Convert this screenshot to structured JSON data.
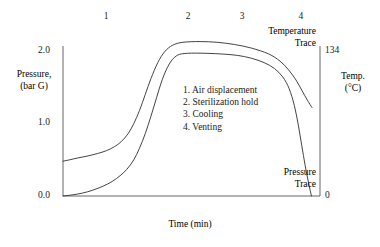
{
  "chart_data": {
    "type": "line",
    "title": "",
    "xlabel": "Time (min)",
    "ylabel": "Pressure,\n(bar G)",
    "y2label": "Temp.\n(°C)",
    "grid": false,
    "legend_position": "inline-annotations",
    "x_axis": {
      "label": "Time (min)",
      "tick_labels": [],
      "range": [
        0,
        4.5
      ]
    },
    "y_axis_left": {
      "label_line1": "Pressure,",
      "label_line2": "(bar G)",
      "tick_labels": [
        "2.0",
        "1.0",
        "0.0"
      ],
      "tick_values": [
        2.0,
        1.0,
        0.0
      ],
      "range": [
        0,
        2.2
      ]
    },
    "y_axis_right": {
      "label_line1": "Temp.",
      "label_line2": "(°C)",
      "tick_labels": [
        "134",
        "0"
      ],
      "tick_values": [
        134,
        0
      ],
      "range": [
        0,
        147
      ]
    },
    "phase_markers": [
      {
        "number": "1",
        "x_frac": 0.168
      },
      {
        "number": "2",
        "x_frac": 0.487
      },
      {
        "number": "3",
        "x_frac": 0.697
      },
      {
        "number": "4",
        "x_frac": 0.926
      }
    ],
    "series": [
      {
        "name": "Temperature Trace",
        "label_line1": "Temperature",
        "label_line2": "Trace",
        "color": "#3a3a3a",
        "axis": "right",
        "points": [
          [
            0.0,
            0.48
          ],
          [
            0.12,
            0.5
          ],
          [
            0.26,
            0.525
          ],
          [
            0.42,
            0.55
          ],
          [
            0.6,
            0.585
          ],
          [
            0.76,
            0.625
          ],
          [
            0.9,
            0.68
          ],
          [
            1.02,
            0.75
          ],
          [
            1.14,
            0.86
          ],
          [
            1.24,
            1.0
          ],
          [
            1.34,
            1.18
          ],
          [
            1.44,
            1.4
          ],
          [
            1.54,
            1.62
          ],
          [
            1.66,
            1.84
          ],
          [
            1.78,
            1.99
          ],
          [
            1.92,
            2.08
          ],
          [
            2.1,
            2.12
          ],
          [
            2.4,
            2.13
          ],
          [
            2.7,
            2.12
          ],
          [
            3.0,
            2.09
          ],
          [
            3.3,
            2.04
          ],
          [
            3.6,
            1.96
          ],
          [
            3.8,
            1.86
          ],
          [
            3.95,
            1.74
          ],
          [
            4.08,
            1.6
          ],
          [
            4.18,
            1.46
          ],
          [
            4.28,
            1.32
          ],
          [
            4.36,
            1.22
          ]
        ]
      },
      {
        "name": "Pressure Trace",
        "label_line1": "Pressure",
        "label_line2": "Trace",
        "color": "#3a3a3a",
        "axis": "left",
        "points": [
          [
            0.0,
            0.0
          ],
          [
            0.16,
            0.015
          ],
          [
            0.34,
            0.04
          ],
          [
            0.52,
            0.08
          ],
          [
            0.7,
            0.135
          ],
          [
            0.86,
            0.2
          ],
          [
            1.0,
            0.28
          ],
          [
            1.12,
            0.37
          ],
          [
            1.24,
            0.5
          ],
          [
            1.34,
            0.66
          ],
          [
            1.44,
            0.86
          ],
          [
            1.54,
            1.1
          ],
          [
            1.64,
            1.36
          ],
          [
            1.74,
            1.61
          ],
          [
            1.86,
            1.82
          ],
          [
            1.98,
            1.93
          ],
          [
            2.12,
            1.965
          ],
          [
            2.4,
            1.97
          ],
          [
            2.75,
            1.96
          ],
          [
            3.05,
            1.94
          ],
          [
            3.3,
            1.9
          ],
          [
            3.52,
            1.84
          ],
          [
            3.7,
            1.76
          ],
          [
            3.85,
            1.64
          ],
          [
            3.96,
            1.48
          ],
          [
            4.05,
            1.25
          ],
          [
            4.12,
            0.98
          ],
          [
            4.18,
            0.7
          ],
          [
            4.24,
            0.42
          ],
          [
            4.3,
            0.18
          ],
          [
            4.35,
            0.0
          ]
        ]
      }
    ],
    "annotations": [
      "1. Air displacement",
      "2. Sterilization hold",
      "3. Cooling",
      "4. Venting"
    ]
  },
  "figure": {
    "background_color": "#ffffff",
    "line_color": "#3a3a3a",
    "axis_color": "#555555"
  }
}
